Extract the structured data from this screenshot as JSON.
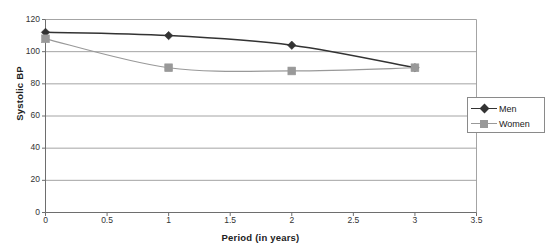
{
  "chart_data": {
    "type": "line",
    "title": "",
    "xlabel": "Period (in years)",
    "ylabel": "Systolic BP",
    "xlim": [
      0,
      3.5
    ],
    "ylim": [
      0,
      120
    ],
    "xticks": [
      "0",
      "0.5",
      "1",
      "1.5",
      "2",
      "2.5",
      "3",
      "3.5"
    ],
    "xtick_values": [
      0,
      0.5,
      1,
      1.5,
      2,
      2.5,
      3,
      3.5
    ],
    "yticks": [
      "0",
      "20",
      "40",
      "60",
      "80",
      "100",
      "120"
    ],
    "ytick_values": [
      0,
      20,
      40,
      60,
      80,
      100,
      120
    ],
    "grid": "horizontal",
    "legend_position": "right",
    "smoothed": true,
    "x": [
      0,
      1,
      2,
      3
    ],
    "series": [
      {
        "name": "Men",
        "values": [
          112,
          110,
          104,
          90
        ],
        "color": "#333333",
        "marker": "diamond"
      },
      {
        "name": "Women",
        "values": [
          108,
          90,
          88,
          90
        ],
        "color": "#999999",
        "marker": "square"
      }
    ]
  },
  "legend": {
    "items": [
      {
        "label": "Men"
      },
      {
        "label": "Women"
      }
    ]
  },
  "colors": {
    "men": "#333333",
    "women": "#999999",
    "grid": "#9a9a9a",
    "axis": "#6e6e6e",
    "background": "#ffffff"
  }
}
